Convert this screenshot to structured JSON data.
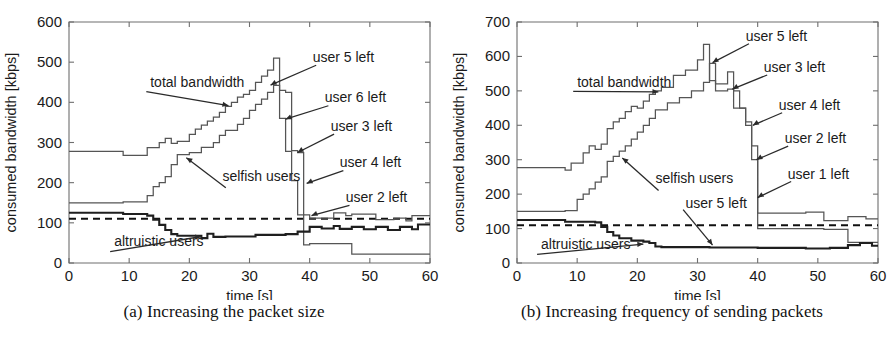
{
  "figure": {
    "panels": [
      {
        "id": "a",
        "caption": "(a) Increasing the packet size",
        "chart_data": {
          "type": "line",
          "title": "",
          "xlabel": "time [s]",
          "ylabel": "consumed bandwidth [kbps]",
          "xlim": [
            0,
            60
          ],
          "ylim": [
            0,
            600
          ],
          "xticks": [
            0,
            10,
            20,
            30,
            40,
            50,
            60
          ],
          "yticks": [
            0,
            100,
            200,
            300,
            400,
            500,
            600
          ],
          "grid": false,
          "legend_position": "inline-annotations",
          "fair_share_line": 110,
          "series": [
            {
              "name": "total bandwidth",
              "style": "step",
              "x": [
                0,
                9,
                9,
                13,
                13,
                15,
                15,
                16,
                16,
                17,
                17,
                18,
                18,
                20,
                20,
                21,
                21,
                22,
                22,
                23,
                23,
                24,
                24,
                25,
                25,
                26,
                26,
                27,
                27,
                28,
                28,
                29,
                29,
                30,
                30,
                31,
                31,
                32,
                32,
                33,
                33,
                34,
                34,
                35,
                35,
                36,
                36,
                37,
                37,
                38,
                38,
                39,
                39,
                40,
                40,
                44,
                44,
                46,
                46,
                47,
                47,
                51,
                51,
                54,
                54,
                56,
                56,
                57,
                57,
                60
              ],
              "y": [
                278,
                278,
                268,
                268,
                287,
                287,
                300,
                300,
                310,
                310,
                298,
                298,
                303,
                303,
                320,
                320,
                333,
                333,
                343,
                343,
                353,
                353,
                363,
                363,
                375,
                375,
                390,
                390,
                400,
                400,
                413,
                413,
                420,
                420,
                430,
                430,
                450,
                450,
                465,
                465,
                480,
                480,
                510,
                510,
                430,
                430,
                425,
                425,
                280,
                280,
                275,
                275,
                120,
                120,
                112,
                112,
                125,
                125,
                118,
                118,
                122,
                122,
                108,
                108,
                112,
                112,
                105,
                105,
                118,
                118
              ]
            },
            {
              "name": "selfish users",
              "style": "step",
              "x": [
                0,
                9,
                9,
                13,
                13,
                14,
                14,
                15,
                15,
                16,
                16,
                17,
                17,
                18,
                18,
                20,
                20,
                22,
                22,
                24,
                24,
                25,
                25,
                26,
                26,
                28,
                28,
                29,
                29,
                30,
                30,
                31,
                31,
                32,
                32,
                33,
                33,
                34,
                34,
                35,
                35,
                36,
                36,
                37,
                37,
                38,
                38,
                39,
                39,
                40,
                40,
                47,
                47,
                60
              ],
              "y": [
                150,
                150,
                152,
                152,
                168,
                168,
                190,
                190,
                200,
                200,
                215,
                215,
                245,
                245,
                270,
                270,
                275,
                275,
                288,
                288,
                300,
                300,
                318,
                318,
                330,
                330,
                345,
                345,
                360,
                360,
                380,
                380,
                395,
                395,
                408,
                408,
                425,
                425,
                442,
                442,
                360,
                360,
                278,
                278,
                205,
                205,
                120,
                120,
                45,
                45,
                48,
                48,
                22,
                22
              ]
            },
            {
              "name": "altruistic users",
              "style": "step",
              "x": [
                0,
                9,
                9,
                13,
                13,
                14,
                14,
                15,
                15,
                16,
                16,
                17,
                17,
                18,
                18,
                22,
                22,
                23,
                23,
                24,
                24,
                26,
                26,
                31,
                31,
                36,
                36,
                38,
                38,
                40,
                40,
                42,
                42,
                44,
                44,
                45,
                45,
                47,
                47,
                49,
                49,
                51,
                51,
                53,
                53,
                55,
                55,
                57,
                57,
                58,
                58,
                60
              ],
              "y": [
                125,
                125,
                122,
                122,
                118,
                118,
                108,
                108,
                95,
                95,
                82,
                82,
                72,
                72,
                68,
                68,
                62,
                62,
                73,
                73,
                65,
                65,
                66,
                66,
                70,
                70,
                72,
                72,
                78,
                78,
                90,
                90,
                86,
                86,
                92,
                92,
                85,
                85,
                90,
                90,
                84,
                84,
                90,
                90,
                82,
                82,
                90,
                90,
                84,
                84,
                96,
                96
              ]
            }
          ],
          "annotations": [
            {
              "label": "total bandwidth",
              "text_x": 13.5,
              "text_y": 437,
              "point_x": 26.5,
              "point_y": 392
            },
            {
              "label": "selfish users",
              "text_x": 25.5,
              "text_y": 205,
              "point_x": 19.5,
              "point_y": 262
            },
            {
              "label": "altruistic users",
              "text_x": 7.5,
              "text_y": 42,
              "point_x": 22.0,
              "point_y": 66
            },
            {
              "label": "user 5 left",
              "text_x": 40.5,
              "text_y": 500,
              "point_x": 33.5,
              "point_y": 443
            },
            {
              "label": "user 6 left",
              "text_x": 42.5,
              "text_y": 400,
              "point_x": 36.0,
              "point_y": 358
            },
            {
              "label": "user 3 left",
              "text_x": 43.5,
              "text_y": 328,
              "point_x": 38.0,
              "point_y": 275
            },
            {
              "label": "user 4 left",
              "text_x": 45.0,
              "text_y": 238,
              "point_x": 39.5,
              "point_y": 198
            },
            {
              "label": "user 2 left",
              "text_x": 46.0,
              "text_y": 152,
              "point_x": 40.3,
              "point_y": 118
            }
          ]
        }
      },
      {
        "id": "b",
        "caption": "(b) Increasing frequency of sending packets",
        "chart_data": {
          "type": "line",
          "title": "",
          "xlabel": "time [s]",
          "ylabel": "consumed bandwidth [kbps]",
          "xlim": [
            0,
            60
          ],
          "ylim": [
            0,
            700
          ],
          "xticks": [
            0,
            10,
            20,
            30,
            40,
            50,
            60
          ],
          "yticks": [
            0,
            100,
            200,
            300,
            400,
            500,
            600,
            700
          ],
          "grid": false,
          "legend_position": "inline-annotations",
          "fair_share_line": 110,
          "series": [
            {
              "name": "total bandwidth",
              "style": "step",
              "x": [
                0,
                8,
                8,
                9,
                9,
                11,
                11,
                12,
                12,
                13,
                13,
                14,
                14,
                15,
                15,
                16,
                16,
                17,
                17,
                18,
                18,
                19,
                19,
                20,
                20,
                21,
                21,
                22,
                22,
                23,
                23,
                24,
                24,
                26,
                26,
                28,
                28,
                30,
                30,
                31,
                31,
                32,
                32,
                33,
                33,
                35,
                35,
                36,
                36,
                37,
                37,
                38,
                38,
                39,
                39,
                40,
                40,
                48,
                48,
                51,
                51,
                55,
                55,
                58,
                58,
                60
              ],
              "y": [
                277,
                277,
                270,
                270,
                290,
                290,
                320,
                320,
                340,
                340,
                330,
                330,
                345,
                345,
                390,
                390,
                410,
                410,
                420,
                420,
                440,
                440,
                455,
                455,
                450,
                450,
                470,
                470,
                490,
                490,
                500,
                500,
                510,
                510,
                545,
                545,
                560,
                560,
                590,
                590,
                635,
                635,
                530,
                530,
                520,
                520,
                555,
                555,
                500,
                500,
                450,
                450,
                410,
                410,
                300,
                300,
                145,
                145,
                148,
                148,
                123,
                123,
                135,
                135,
                128,
                128
              ]
            },
            {
              "name": "selfish users",
              "style": "step",
              "x": [
                0,
                8,
                8,
                10,
                10,
                11,
                11,
                12,
                12,
                13,
                13,
                14,
                14,
                15,
                15,
                16,
                16,
                17,
                17,
                18,
                18,
                19,
                19,
                20,
                20,
                21,
                21,
                22,
                22,
                23,
                23,
                25,
                25,
                27,
                27,
                29,
                29,
                31,
                31,
                32,
                32,
                33,
                33,
                35,
                35,
                36,
                36,
                38,
                38,
                39,
                39,
                40,
                40,
                51,
                51,
                55,
                55,
                60
              ],
              "y": [
                150,
                150,
                152,
                152,
                185,
                185,
                200,
                200,
                215,
                215,
                235,
                235,
                250,
                250,
                295,
                295,
                310,
                310,
                325,
                325,
                340,
                340,
                360,
                360,
                380,
                380,
                400,
                400,
                420,
                420,
                445,
                445,
                465,
                465,
                480,
                480,
                500,
                500,
                525,
                525,
                580,
                580,
                500,
                500,
                505,
                505,
                450,
                450,
                400,
                400,
                340,
                340,
                100,
                100,
                98,
                98,
                60,
                60
              ]
            },
            {
              "name": "altruistic users",
              "style": "step",
              "x": [
                0,
                8,
                8,
                13,
                13,
                14,
                14,
                15,
                15,
                16,
                16,
                17,
                17,
                19,
                19,
                21,
                21,
                22,
                22,
                23,
                23,
                24,
                24,
                32,
                32,
                40,
                40,
                48,
                48,
                52,
                52,
                55,
                55,
                57,
                57,
                59,
                59,
                60
              ],
              "y": [
                125,
                125,
                120,
                120,
                118,
                118,
                105,
                105,
                90,
                90,
                80,
                80,
                72,
                72,
                65,
                65,
                62,
                62,
                58,
                58,
                48,
                48,
                46,
                46,
                45,
                45,
                44,
                44,
                42,
                42,
                44,
                44,
                52,
                52,
                58,
                58,
                50,
                50
              ]
            }
          ],
          "annotations": [
            {
              "label": "total bandwidth",
              "text_x": 10.0,
              "text_y": 512,
              "point_x": 23.5,
              "point_y": 497
            },
            {
              "label": "selfish users",
              "text_x": 23.0,
              "text_y": 232,
              "point_x": 17.5,
              "point_y": 305
            },
            {
              "label": "altruistic users",
              "text_x": 4.0,
              "text_y": 40,
              "point_x": 21.0,
              "point_y": 55
            },
            {
              "label": "user 5 left",
              "text_x": 38.0,
              "text_y": 645,
              "point_x": 32.5,
              "point_y": 582
            },
            {
              "label": "user 3 left",
              "text_x": 41.0,
              "text_y": 555,
              "point_x": 35.8,
              "point_y": 505
            },
            {
              "label": "user 4 left",
              "text_x": 43.5,
              "text_y": 445,
              "point_x": 39.2,
              "point_y": 400
            },
            {
              "label": "user 2 left",
              "text_x": 44.5,
              "text_y": 348,
              "point_x": 39.8,
              "point_y": 300
            },
            {
              "label": "user 1 left",
              "text_x": 45.0,
              "text_y": 245,
              "point_x": 40.0,
              "point_y": 190
            },
            {
              "label": "user 5 left",
              "text_x": 28.0,
              "text_y": 160,
              "point_x": 32.5,
              "point_y": 52
            }
          ]
        }
      }
    ]
  }
}
